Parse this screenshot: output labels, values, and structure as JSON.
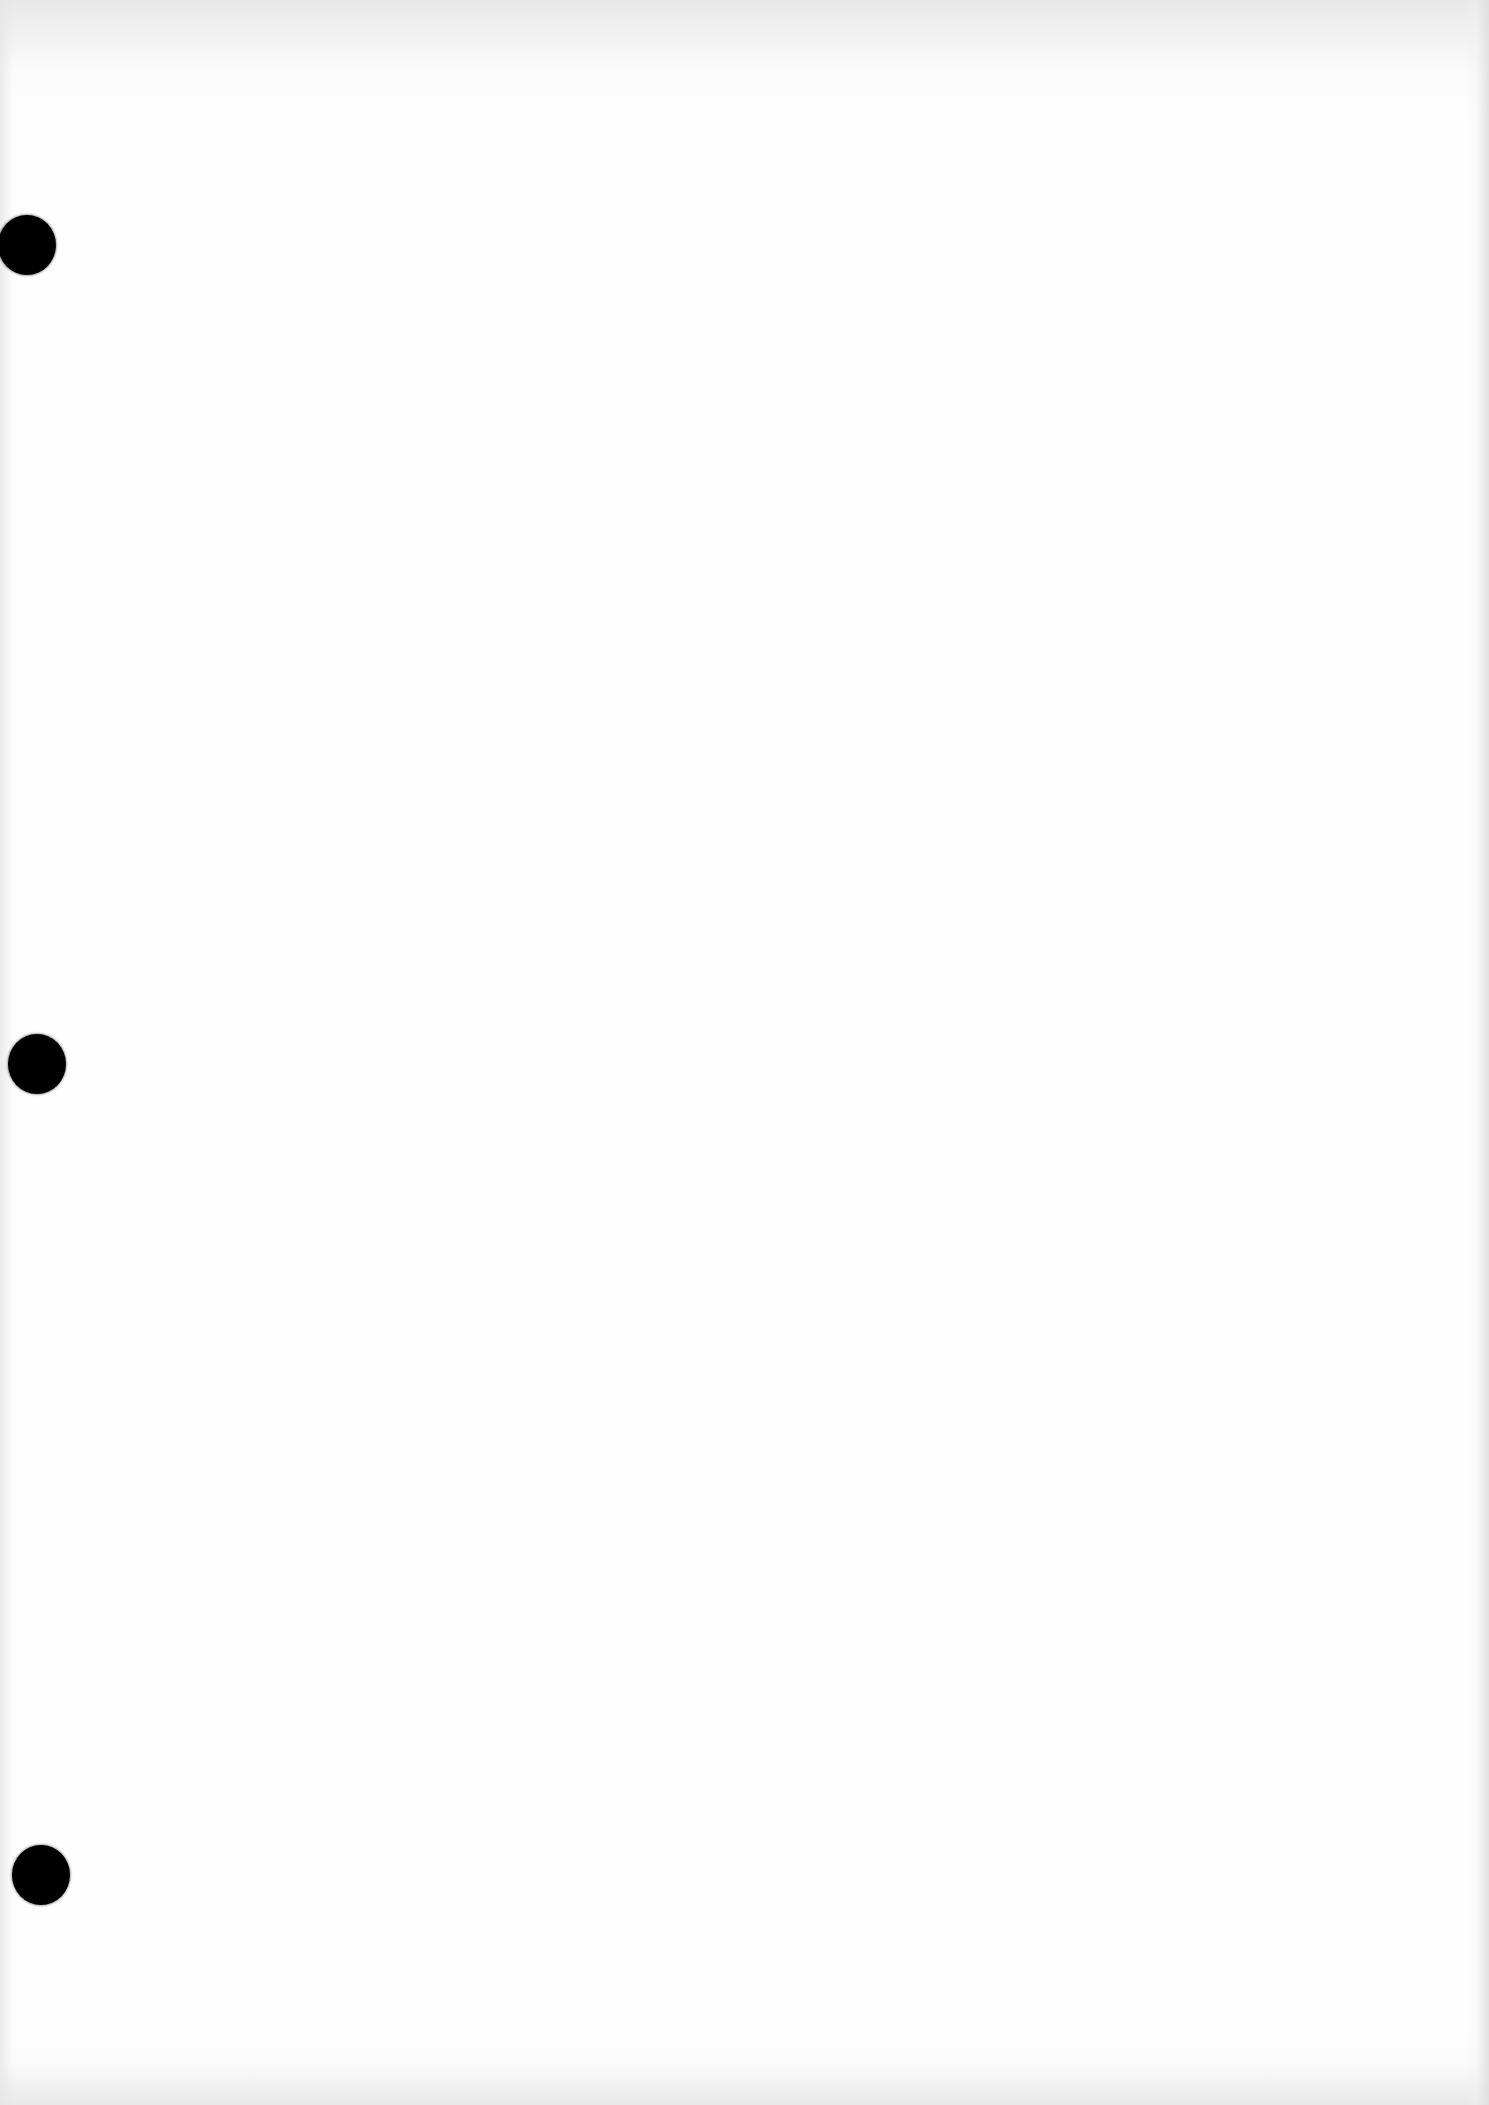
{
  "document": {
    "type": "blank scanned page",
    "text": [],
    "punch_holes": [
      {
        "id": "top",
        "center_x": 28,
        "center_y": 245
      },
      {
        "id": "middle",
        "center_x": 37,
        "center_y": 1064
      },
      {
        "id": "bottom",
        "center_x": 41,
        "center_y": 1875
      }
    ],
    "colors": {
      "paper": "#fefefe",
      "hole": "#000000",
      "scan_edge": "#e0e0e0"
    }
  }
}
